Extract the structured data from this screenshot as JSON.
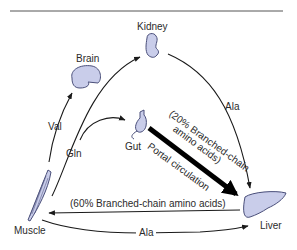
{
  "diagram": {
    "title_rule": true,
    "nodes": {
      "brain": "Brain",
      "kidney": "Kidney",
      "gut": "Gut",
      "muscle": "Muscle",
      "liver": "Liver"
    },
    "edges": {
      "muscle_to_brain": "Val",
      "muscle_to_kidney_gut": "Gln",
      "kidney_to_liver": "Ala",
      "gut_to_liver_line1": "(20% Branched-chain",
      "gut_to_liver_line2": "amino acids)",
      "gut_to_liver_line3": "Portal circulation",
      "liver_to_muscle": "(60% Branched-chain amino acids)",
      "muscle_to_liver": "Ala"
    },
    "colors": {
      "organ_fill": "#c9cdea",
      "organ_stroke": "#4a4f7a",
      "arrow": "#1a1a1a"
    }
  }
}
